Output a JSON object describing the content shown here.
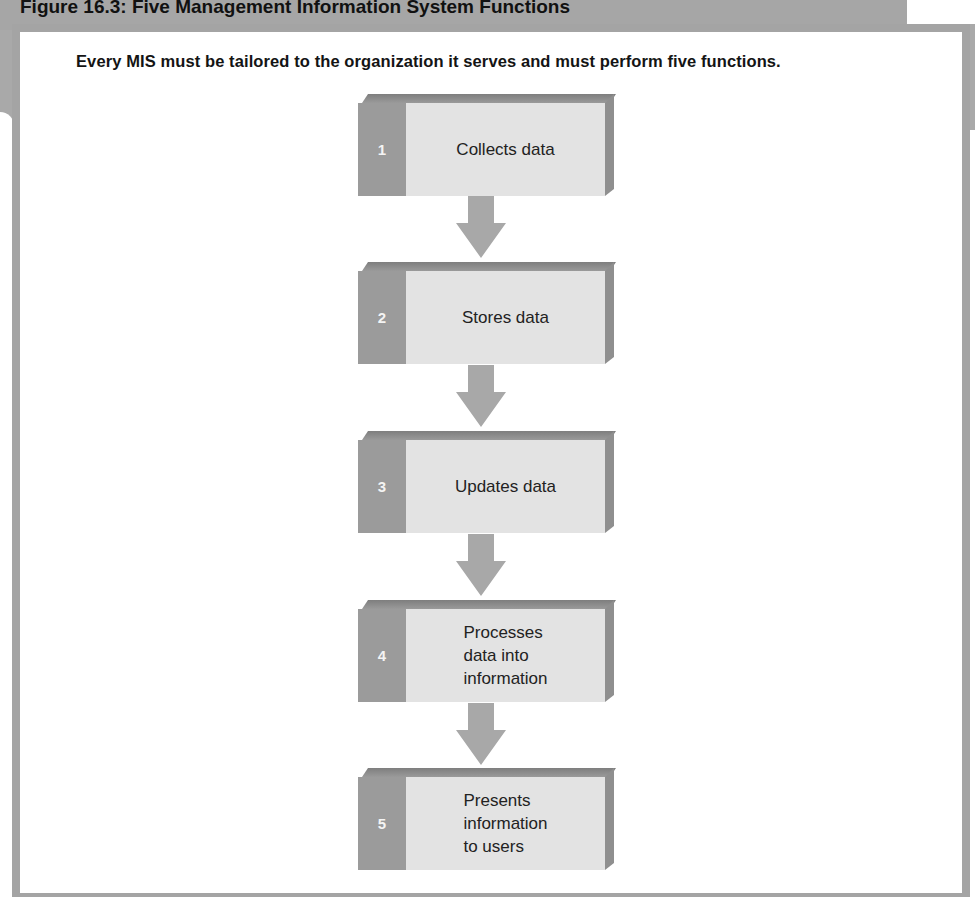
{
  "figure": {
    "title": "Figure 16.3: Five Management Information System Functions",
    "subtitle": "Every MIS must be tailored to the organization it serves and must perform five functions."
  },
  "colors": {
    "frame_gray": "#a4a4a4",
    "box_face": "#e3e3e3",
    "box_number_column": "#9b9b9b",
    "arrow": "#a8a8a8"
  },
  "steps": [
    {
      "number": "1",
      "label": "Collects data"
    },
    {
      "number": "2",
      "label": "Stores data"
    },
    {
      "number": "3",
      "label": "Updates data"
    },
    {
      "number": "4",
      "label": "Processes\ndata into\ninformation"
    },
    {
      "number": "5",
      "label": "Presents\ninformation\nto users"
    }
  ],
  "arrows": [
    {
      "from": "1",
      "to": "2",
      "icon": "down-arrow-icon"
    },
    {
      "from": "2",
      "to": "3",
      "icon": "down-arrow-icon"
    },
    {
      "from": "3",
      "to": "4",
      "icon": "down-arrow-icon"
    },
    {
      "from": "4",
      "to": "5",
      "icon": "down-arrow-icon"
    }
  ]
}
